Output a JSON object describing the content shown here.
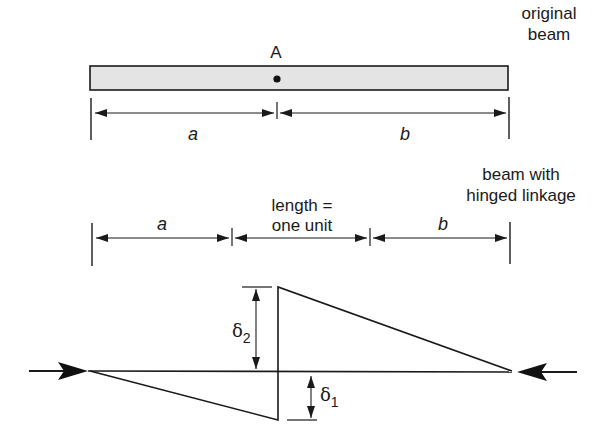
{
  "colors": {
    "line": "#1a1a1a",
    "beam_fill": "#e4e4e4",
    "background": "#ffffff"
  },
  "original_beam": {
    "label_line1": "original",
    "label_line2": "beam",
    "point_label": "A",
    "dim_a_label": "a",
    "dim_b_label": "b"
  },
  "hinged_beam": {
    "label_line1": "beam with",
    "label_line2": "hinged linkage",
    "dim_a_label": "a",
    "dim_mid_label_line1": "length =",
    "dim_mid_label_line2": "one unit",
    "dim_b_label": "b"
  },
  "deflection": {
    "delta2_symbol": "δ",
    "delta2_sub": "2",
    "delta1_symbol": "δ",
    "delta1_sub": "1"
  }
}
